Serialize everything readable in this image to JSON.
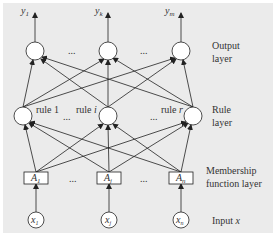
{
  "diagram": {
    "type": "neural-fuzzy network",
    "layers": [
      {
        "id": "output",
        "label_line1": "Output",
        "label_line2": "layer",
        "nodes": [
          {
            "label": "y",
            "sub": "1"
          },
          {
            "label": "y",
            "sub": "k"
          },
          {
            "label": "y",
            "sub": "m"
          }
        ]
      },
      {
        "id": "rule",
        "label_line1": "Rule",
        "label_line2": "layer",
        "nodes": [
          {
            "label": "rule 1"
          },
          {
            "label": "rule ",
            "ital": "i"
          },
          {
            "label": "rule ",
            "ital": "r"
          }
        ]
      },
      {
        "id": "membership",
        "label_line1": "Membership",
        "label_line2": "function layer",
        "nodes": [
          {
            "label": "A",
            "sub": "1"
          },
          {
            "label": "A",
            "sub": "j"
          },
          {
            "label": "A",
            "sub": "n"
          }
        ]
      },
      {
        "id": "input",
        "label_line1": "Input ",
        "label_ital": "x",
        "nodes": [
          {
            "label": "x",
            "sub": "1"
          },
          {
            "label": "x",
            "sub": "j"
          },
          {
            "label": "x",
            "sub": "n"
          }
        ]
      }
    ],
    "ellipsis": "..."
  },
  "colors": {
    "background": "#ebebeb",
    "stroke": "#222222",
    "node_fill": "#ffffff"
  }
}
